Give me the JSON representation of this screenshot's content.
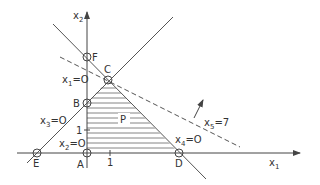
{
  "diagram": {
    "type": "linear-program-feasible-region",
    "axes": {
      "x_label": "x",
      "x_sub": "1",
      "y_label": "x",
      "y_sub": "2",
      "x_tick": "1",
      "y_tick": "1"
    },
    "region_label": "P",
    "vertices": {
      "A": "A",
      "B": "B",
      "C": "C",
      "D": "D",
      "E": "E",
      "F": "F"
    },
    "constraints": [
      {
        "id": "x1",
        "var": "x",
        "sub": "1",
        "eq": "=O"
      },
      {
        "id": "x2",
        "var": "x",
        "sub": "2",
        "eq": "=O"
      },
      {
        "id": "x3",
        "var": "x",
        "sub": "3",
        "eq": "=O"
      },
      {
        "id": "x4",
        "var": "x",
        "sub": "4",
        "eq": "=O"
      },
      {
        "id": "x5",
        "var": "x",
        "sub": "5",
        "eq": "=7"
      }
    ],
    "colors": {
      "line": "#555555",
      "hatch": "#777777"
    }
  }
}
